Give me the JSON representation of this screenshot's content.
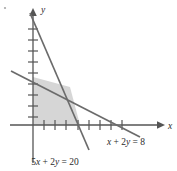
{
  "figure": {
    "kind": "linear-programming-feasible-region",
    "background_color": "#ffffff",
    "axis_color": "#555555",
    "line_color": "#6b6b6b",
    "shade_color": "#d6d6d6",
    "text_color": "#2b2b2b"
  },
  "axes": {
    "x_axis_label": "x",
    "y_axis_label": "y",
    "x_tick_count": 8,
    "y_tick_count": 9,
    "origin_px": {
      "x": 33,
      "y": 125
    },
    "x_end_px": 163,
    "y_end_px": 8
  },
  "lines": [
    {
      "id": "line-steep",
      "equation_label": "5x + 2y = 20",
      "label_parts": {
        "a": "5",
        "x": "x",
        "plus": " + ",
        "b": "2",
        "y": "y",
        "eq": " = ",
        "rhs": "20"
      },
      "label_pos_px": {
        "x": 55,
        "y": 162
      },
      "slope_desc": "steep-negative",
      "x_intercept_px": 80,
      "y_intercept_px": 21
    },
    {
      "id": "line-shallow",
      "equation_label": "x + 2y = 8",
      "label_parts": {
        "x": "x",
        "plus": " + ",
        "b": "2",
        "y": "y",
        "eq": " = ",
        "rhs": "8"
      },
      "label_pos_px": {
        "x": 126,
        "y": 149
      },
      "slope_desc": "shallow-negative",
      "x_intercept_px": 120,
      "y_intercept_px": 77
    }
  ],
  "intersection_px": {
    "x": 70,
    "y": 87
  },
  "shaded_region": {
    "description": "feasible region bounded by axes and both lines",
    "vertices_px": [
      {
        "x": 33,
        "y": 125
      },
      {
        "x": 33,
        "y": 77
      },
      {
        "x": 70,
        "y": 87
      },
      {
        "x": 80,
        "y": 125
      }
    ]
  },
  "artifact_dot": {
    "x": 5,
    "y": 8,
    "visible": true
  }
}
